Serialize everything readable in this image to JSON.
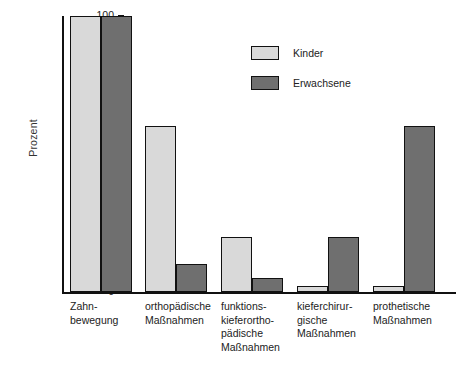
{
  "chart_data": {
    "type": "bar",
    "title": "",
    "xlabel": "",
    "ylabel": "Prozent",
    "ylim": [
      0,
      100
    ],
    "yticks": [
      0,
      10,
      20,
      30,
      40,
      50,
      60,
      70,
      80,
      90,
      100
    ],
    "grid": false,
    "legend_position": "top-center",
    "categories": [
      "Zahn-\nbewegung",
      "orthopädische\nMaßnahmen",
      "funktions-\nkieferortho-\npädische\nMaßnahmen",
      "kieferchirur-\ngische\nMaßnahmen",
      "prothetische\nMaßnahmen"
    ],
    "category_lines": [
      [
        "Zahn-",
        "bewegung"
      ],
      [
        "orthopädische",
        "Maßnahmen"
      ],
      [
        "funktions-",
        "kieferortho-",
        "pädische",
        "Maßnahmen"
      ],
      [
        "kieferchirur-",
        "gische",
        "Maßnahmen"
      ],
      [
        "prothetische",
        "Maßnahmen"
      ]
    ],
    "series": [
      {
        "name": "Kinder",
        "color": "#d9d9d9",
        "values": [
          100,
          60,
          20,
          2,
          2
        ]
      },
      {
        "name": "Erwachsene",
        "color": "#6f6f6f",
        "values": [
          100,
          10,
          5,
          20,
          60
        ]
      }
    ]
  },
  "axis": {
    "y_label": "Prozent",
    "y_ticks": [
      "0",
      "10",
      "20",
      "30",
      "40",
      "50",
      "60",
      "70",
      "80",
      "90",
      "100"
    ]
  },
  "legend": {
    "items": [
      {
        "label": "Kinder",
        "color": "#d9d9d9"
      },
      {
        "label": "Erwachsene",
        "color": "#6f6f6f"
      }
    ]
  },
  "colors": {
    "kinder": "#d9d9d9",
    "erwachsene": "#6f6f6f",
    "axis": "#111111",
    "background": "#ffffff"
  }
}
